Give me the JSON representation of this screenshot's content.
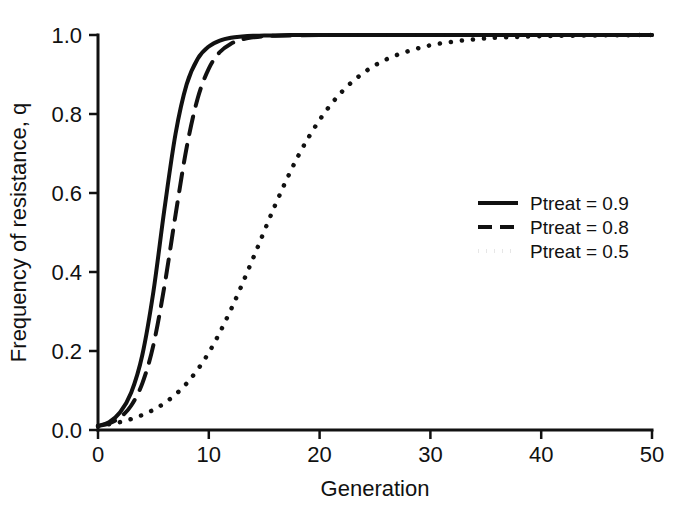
{
  "figure": {
    "background_color": "#ffffff",
    "ink_color": "#111111",
    "width": 684,
    "height": 513
  },
  "chart_data": {
    "type": "line",
    "title": "",
    "xlabel": "Generation",
    "ylabel": "Frequency of resistance, q",
    "xlim": [
      0,
      50
    ],
    "ylim": [
      0.0,
      1.0
    ],
    "xticks": [
      0,
      10,
      20,
      30,
      40,
      50
    ],
    "xtick_labels": [
      "0",
      "10",
      "20",
      "30",
      "40",
      "50"
    ],
    "yticks": [
      0.0,
      0.2,
      0.4,
      0.6,
      0.8,
      1.0
    ],
    "ytick_labels": [
      "0.0",
      "0.2",
      "0.4",
      "0.6",
      "0.8",
      "1.0"
    ],
    "grid": false,
    "legend_position": "center-right",
    "series": [
      {
        "name": "Ptreat = 0.9",
        "style": "solid",
        "color": "#111111",
        "width": 4,
        "x": [
          0,
          1,
          2,
          3,
          4,
          5,
          6,
          7,
          8,
          9,
          10,
          11,
          12,
          13,
          14,
          15,
          16,
          18,
          20,
          25,
          30,
          35,
          40,
          45,
          50
        ],
        "y": [
          0.01,
          0.02,
          0.045,
          0.095,
          0.19,
          0.35,
          0.56,
          0.75,
          0.875,
          0.94,
          0.971,
          0.986,
          0.993,
          0.996,
          0.998,
          0.999,
          0.999,
          1.0,
          1.0,
          1.0,
          1.0,
          1.0,
          1.0,
          1.0,
          1.0
        ]
      },
      {
        "name": "Ptreat = 0.8",
        "style": "dashed",
        "color": "#111111",
        "width": 4,
        "x": [
          0,
          1,
          2,
          3,
          4,
          5,
          6,
          7,
          8,
          9,
          10,
          11,
          12,
          13,
          14,
          15,
          16,
          18,
          20,
          25,
          30,
          35,
          40,
          45,
          50
        ],
        "y": [
          0.01,
          0.017,
          0.032,
          0.062,
          0.118,
          0.215,
          0.365,
          0.545,
          0.715,
          0.84,
          0.915,
          0.957,
          0.978,
          0.989,
          0.994,
          0.997,
          0.998,
          0.999,
          1.0,
          1.0,
          1.0,
          1.0,
          1.0,
          1.0,
          1.0
        ]
      },
      {
        "name": "Ptreat = 0.5",
        "style": "dotted",
        "color": "#111111",
        "width": 4.5,
        "x": [
          0,
          2,
          4,
          6,
          8,
          10,
          12,
          14,
          16,
          18,
          20,
          22,
          24,
          26,
          28,
          30,
          32,
          34,
          36,
          40,
          45,
          50
        ],
        "y": [
          0.01,
          0.02,
          0.038,
          0.068,
          0.118,
          0.196,
          0.305,
          0.435,
          0.57,
          0.69,
          0.785,
          0.856,
          0.905,
          0.938,
          0.959,
          0.974,
          0.983,
          0.989,
          0.993,
          0.997,
          0.999,
          1.0
        ]
      }
    ]
  },
  "legend": {
    "entries": [
      {
        "label": "Ptreat = 0.9",
        "style": "solid"
      },
      {
        "label": "Ptreat = 0.8",
        "style": "dashed"
      },
      {
        "label": "Ptreat = 0.5",
        "style": "dotted"
      }
    ]
  }
}
